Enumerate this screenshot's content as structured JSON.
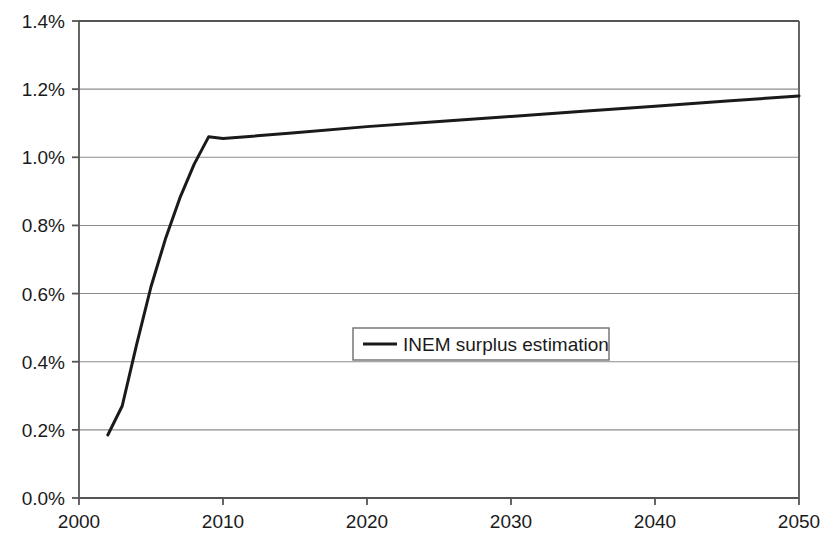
{
  "chart_data": {
    "type": "line",
    "title": "",
    "subtitle": "",
    "xlabel": "",
    "ylabel": "",
    "xlim": [
      2000,
      2050
    ],
    "ylim": [
      0.0,
      1.4
    ],
    "grid": "horizontal",
    "legend_position": "center",
    "x_ticks": [
      "2000",
      "2010",
      "2020",
      "2030",
      "2040",
      "2050"
    ],
    "x_tick_values": [
      2000,
      2010,
      2020,
      2030,
      2040,
      2050
    ],
    "y_ticks": [
      "0.0%",
      "0.2%",
      "0.4%",
      "0.6%",
      "0.8%",
      "1.0%",
      "1.2%",
      "1.4%"
    ],
    "y_tick_values": [
      0.0,
      0.2,
      0.4,
      0.6,
      0.8,
      1.0,
      1.2,
      1.4
    ],
    "series": [
      {
        "name": "INEM surplus estimation",
        "color": "#1a1a1a",
        "line_width": 3,
        "x": [
          2002,
          2003,
          2004,
          2005,
          2006,
          2007,
          2008,
          2009,
          2010,
          2015,
          2020,
          2025,
          2030,
          2035,
          2040,
          2045,
          2050
        ],
        "values": [
          0.185,
          0.27,
          0.45,
          0.62,
          0.76,
          0.88,
          0.98,
          1.06,
          1.055,
          1.072,
          1.09,
          1.105,
          1.12,
          1.135,
          1.15,
          1.165,
          1.18
        ]
      }
    ],
    "legend": [
      {
        "label": "INEM surplus estimation",
        "color": "#1a1a1a"
      }
    ]
  },
  "axis_colors": {
    "grid": "#8c8c8c",
    "axis": "#555555",
    "text": "#1a1a1a",
    "plot_background": "#ffffff",
    "legend_border": "#6e6e6e"
  }
}
